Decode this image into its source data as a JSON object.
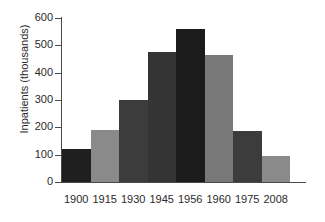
{
  "chart_data": {
    "type": "bar",
    "title": "",
    "subtitle": "",
    "xlabel": "",
    "ylabel": "Inpatients (thousands)",
    "categories": [
      "1900",
      "1915",
      "1930",
      "1945",
      "1956",
      "1960",
      "1975",
      "2008"
    ],
    "values": [
      122,
      190,
      300,
      475,
      560,
      465,
      185,
      97
    ],
    "series": [
      {
        "name": "Inpatients",
        "values": [
          122,
          190,
          300,
          475,
          560,
          465,
          185,
          97
        ]
      }
    ],
    "bar_colors": [
      "#1f1f1f",
      "#8a8a8a",
      "#3c3c3c",
      "#343434",
      "#1b1b1b",
      "#787878",
      "#3c3c3c",
      "#8a8a8a"
    ],
    "ylim": [
      0,
      600
    ],
    "yticks": [
      0,
      100,
      200,
      300,
      400,
      500,
      600
    ],
    "ytick_labels": [
      "0",
      "100",
      "200",
      "300",
      "400",
      "500",
      "600"
    ],
    "xtick_labels": [
      "1900",
      "1915",
      "1930",
      "1945",
      "1956",
      "1960",
      "1975",
      "2008"
    ],
    "grid": false,
    "legend": false,
    "legend_position": "none",
    "bar_gap": 0,
    "axis_color": "#4a4a4a",
    "text_color": "#2a2a2a",
    "background": "#ffffff"
  }
}
